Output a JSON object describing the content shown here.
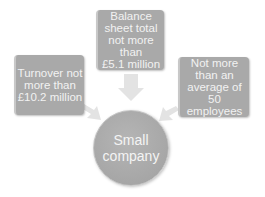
{
  "diagram": {
    "center": {
      "label": "Small\ncompany"
    },
    "criteria": [
      {
        "position": "top",
        "label": "Balance\nsheet total\nnot more than\n£5.1 million"
      },
      {
        "position": "left",
        "label": "Turnover not\nmore than\n£10.2 million"
      },
      {
        "position": "right",
        "label": "Not more\nthan an\naverage of 50\nemployees"
      }
    ],
    "colors": {
      "box": "#a9a9a9",
      "text": "#f2f2f2",
      "arrow": "#e0e0e0"
    }
  }
}
